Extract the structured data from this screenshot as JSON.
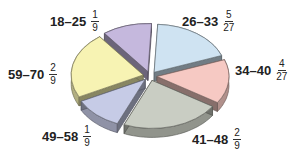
{
  "chart_data": {
    "type": "pie",
    "style": "3d-exploded",
    "title": "",
    "categories": [
      "26–33",
      "34–40",
      "41–48",
      "49–58",
      "59–70",
      "18–25"
    ],
    "values": [
      0.1852,
      0.1481,
      0.2222,
      0.1111,
      0.2222,
      0.1111
    ],
    "fractions": [
      {
        "label": "26–33",
        "num": "5",
        "den": "27",
        "color": "#cfe3f2"
      },
      {
        "label": "34–40",
        "num": "4",
        "den": "27",
        "color": "#f6c9c3"
      },
      {
        "label": "41–48",
        "num": "2",
        "den": "9",
        "color": "#c9cdc3"
      },
      {
        "label": "49–58",
        "num": "1",
        "den": "9",
        "color": "#c6cbe6"
      },
      {
        "label": "59–70",
        "num": "2",
        "den": "9",
        "color": "#f7f3b3"
      },
      {
        "label": "18–25",
        "num": "1",
        "den": "9",
        "color": "#c5b8dd"
      }
    ],
    "legend": "none (direct labels)"
  },
  "labels": {
    "a1825": {
      "range": "18–25",
      "num": "1",
      "den": "9"
    },
    "a2633": {
      "range": "26–33",
      "num": "5",
      "den": "27"
    },
    "a3440": {
      "range": "34–40",
      "num": "4",
      "den": "27"
    },
    "a4148": {
      "range": "41–48",
      "num": "2",
      "den": "9"
    },
    "a4958": {
      "range": "49–58",
      "num": "1",
      "den": "9"
    },
    "a5970": {
      "range": "59–70",
      "num": "2",
      "den": "9"
    }
  }
}
